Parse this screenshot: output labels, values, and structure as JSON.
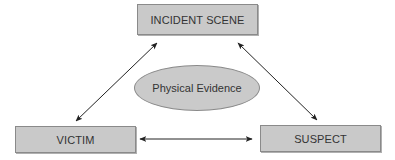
{
  "diagram": {
    "type": "relationship-triangle",
    "nodes": [
      {
        "id": "incident_scene",
        "label": "INCIDENT SCENE",
        "shape": "rectangle"
      },
      {
        "id": "victim",
        "label": "VICTIM",
        "shape": "rectangle"
      },
      {
        "id": "suspect",
        "label": "SUSPECT",
        "shape": "rectangle"
      }
    ],
    "center": {
      "label": "Physical Evidence",
      "shape": "ellipse"
    },
    "edges": [
      {
        "from": "victim",
        "to": "incident_scene",
        "direction": "bidirectional"
      },
      {
        "from": "incident_scene",
        "to": "suspect",
        "direction": "bidirectional"
      },
      {
        "from": "victim",
        "to": "suspect",
        "direction": "bidirectional"
      }
    ],
    "colors": {
      "box_fill": "#c9c9c9",
      "box_border": "#8a8a8a",
      "text": "#333333",
      "arrow": "#222222",
      "background": "#ffffff"
    }
  }
}
